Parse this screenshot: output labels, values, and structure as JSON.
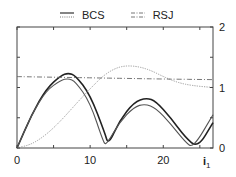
{
  "legend": [
    {
      "label": "BCS",
      "glyph": "solid-over-dotted"
    },
    {
      "label": "RSJ",
      "glyph": "dash-dot"
    }
  ],
  "axes": {
    "x": {
      "label": "i",
      "label_subscript": "1",
      "ticks": [
        "0",
        "10",
        "20"
      ]
    },
    "y_right": {
      "ticks": [
        "2",
        "1",
        "0"
      ]
    }
  },
  "chart_data": {
    "type": "line",
    "title": "",
    "legend_entries": [
      "BCS",
      "RSJ"
    ],
    "legend_position": "top",
    "xlabel": "i1",
    "ylabel": "",
    "xlim": [
      0,
      26.8
    ],
    "ylim": [
      0,
      2
    ],
    "x_ticks": [
      0,
      10,
      20
    ],
    "y_ticks": [
      0,
      1,
      2
    ],
    "y_axis_side": "right",
    "grid": false,
    "series": [
      {
        "name": "solid-upper",
        "style": "solid dark",
        "x": [
          0,
          2,
          4,
          6,
          7,
          8,
          10,
          12,
          12.5,
          14,
          16,
          17.7,
          19,
          21,
          23,
          24.7,
          26.8
        ],
        "y": [
          0,
          0.55,
          0.98,
          1.2,
          1.24,
          1.2,
          0.88,
          0.25,
          0.05,
          0.45,
          0.76,
          0.83,
          0.77,
          0.5,
          0.18,
          0.0,
          0.42
        ]
      },
      {
        "name": "solid-lower",
        "style": "solid gray",
        "x": [
          0,
          2,
          4,
          6,
          7,
          8,
          10,
          11.8,
          12.2,
          14,
          16,
          17.5,
          19,
          21,
          23,
          24.1,
          26.8
        ],
        "y": [
          0,
          0.55,
          0.95,
          1.12,
          1.15,
          1.1,
          0.75,
          0.1,
          0.05,
          0.42,
          0.68,
          0.73,
          0.66,
          0.4,
          0.1,
          0.0,
          0.55
        ]
      },
      {
        "name": "dotted",
        "style": "dotted",
        "x": [
          0,
          2,
          4,
          6,
          8,
          10,
          12,
          14,
          16,
          18,
          20,
          22,
          24,
          26.8
        ],
        "y": [
          0,
          0.06,
          0.22,
          0.45,
          0.72,
          0.98,
          1.22,
          1.35,
          1.36,
          1.3,
          1.18,
          1.08,
          1.03,
          1.0
        ]
      },
      {
        "name": "dash-dot",
        "style": "dash-dot",
        "x": [
          0,
          5,
          10,
          15,
          20,
          26.8
        ],
        "y": [
          1.18,
          1.17,
          1.16,
          1.15,
          1.14,
          1.13
        ]
      }
    ]
  }
}
